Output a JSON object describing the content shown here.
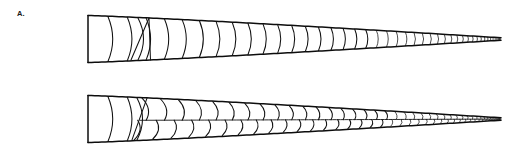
{
  "figure": {
    "background_color": "#ffffff",
    "ink_color": "#0d0d0d",
    "width": 518,
    "height": 159,
    "caption": "",
    "panels": [
      {
        "id": "A",
        "label": "A.",
        "label_x": 17,
        "label_y": 10,
        "description": "Elongate tapering wedge with simple transverse curved growth bands, convex toward the narrow tip; a single oblique discontinuity near the proximal third; band spacing decreases markedly toward the distal tip.",
        "pattern": "transverse-bands",
        "axis_y": 39,
        "origin_x": 88,
        "tip_x": 501,
        "proximal_half_height": 23.5,
        "distal_half_height": 1.2,
        "band_count": 46,
        "anomaly_x": 140,
        "dense_zone_start_x": 374,
        "band_curvature": 0.42,
        "top_edge_slope": 0.5,
        "bottom_edge_slope": -0.5
      },
      {
        "id": "B",
        "label": "B.",
        "label_x": 17,
        "label_y": 91,
        "description": "Elongate tapering wedge with chevron / herringbone internal pattern; bands split at a median line into opposed upper and lower sets, giving a zig-zag appearance along the whole length except the proximal few simple bands.",
        "pattern": "chevron-herringbone",
        "axis_y": 119,
        "origin_x": 88,
        "tip_x": 501,
        "proximal_half_height": 23.5,
        "distal_half_height": 1.2,
        "band_count": 46,
        "simple_band_count": 5,
        "chevron_start_x": 140,
        "dense_zone_start_x": 392,
        "band_curvature": 0.42,
        "top_edge_slope": 0.5,
        "bottom_edge_slope": -0.5
      }
    ]
  },
  "chart_data": {
    "type": "line",
    "title": "",
    "xlabel": "",
    "ylabel": "",
    "series": [
      {
        "name": "A outline half-height",
        "x": [
          88,
          140,
          200,
          260,
          320,
          374,
          430,
          470,
          501
        ],
        "values": [
          23.5,
          21.0,
          17.2,
          13.4,
          9.6,
          6.2,
          3.2,
          1.9,
          1.0
        ]
      },
      {
        "name": "B outline half-height",
        "x": [
          88,
          140,
          200,
          260,
          320,
          392,
          430,
          470,
          501
        ],
        "values": [
          23.5,
          21.0,
          17.2,
          13.4,
          9.6,
          5.0,
          3.2,
          1.9,
          1.0
        ]
      }
    ]
  }
}
